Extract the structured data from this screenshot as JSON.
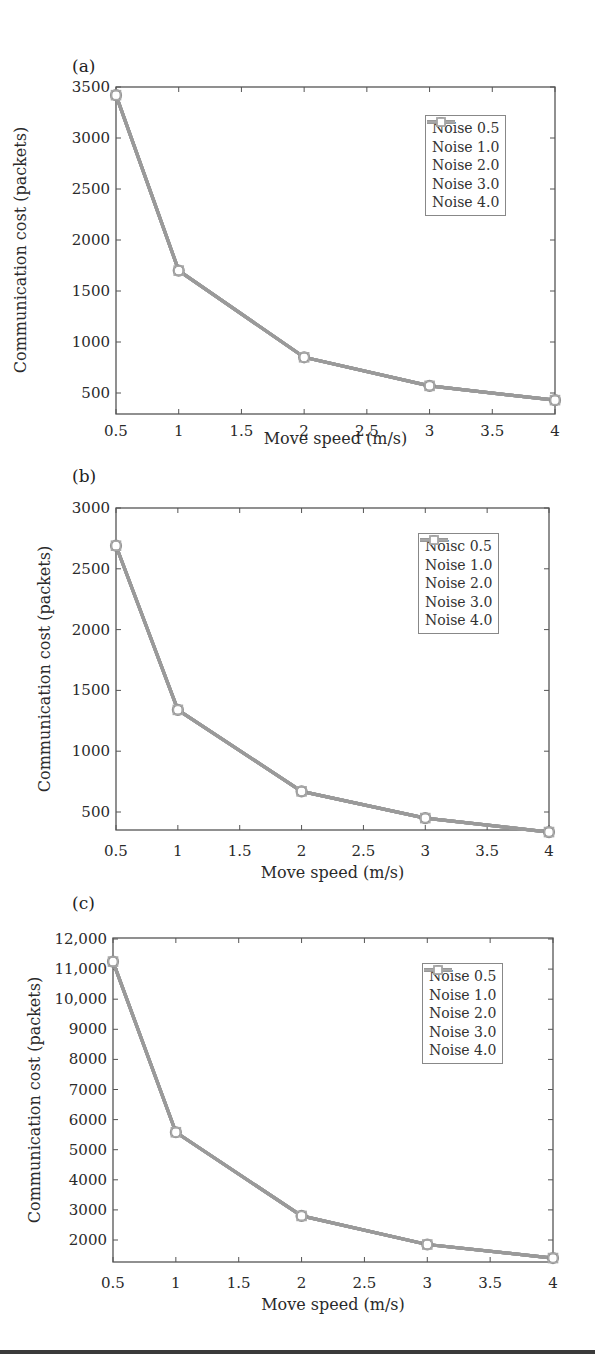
{
  "figure": {
    "panels": [
      {
        "label": "(a)"
      },
      {
        "label": "(b)"
      },
      {
        "label": "(c)"
      }
    ]
  },
  "chart_data": [
    {
      "type": "line",
      "panel": "(a)",
      "title": "",
      "xlabel": "Move speed (m/s)",
      "ylabel": "Communication cost (packets)",
      "x": [
        0.5,
        1,
        2,
        3,
        4
      ],
      "xlim": [
        0.5,
        4
      ],
      "ylim": [
        320,
        3500
      ],
      "xticks": [
        "0.5",
        "1",
        "1.5",
        "2",
        "2.5",
        "3",
        "3.5",
        "4"
      ],
      "yticks": [
        "500",
        "1000",
        "1500",
        "2000",
        "2500",
        "3000",
        "3500"
      ],
      "grid": false,
      "legend_position": "upper right",
      "legend": [
        "Noise 0.5",
        "Noise 1.0",
        "Noise 2.0",
        "Noise 3.0",
        "Noise 4.0"
      ],
      "series": [
        {
          "name": "Noise 0.5",
          "values": [
            3420,
            1700,
            850,
            570,
            430
          ]
        },
        {
          "name": "Noise 1.0",
          "values": [
            3420,
            1700,
            850,
            570,
            430
          ]
        },
        {
          "name": "Noise 2.0",
          "values": [
            3420,
            1700,
            850,
            570,
            430
          ]
        },
        {
          "name": "Noise 3.0",
          "values": [
            3420,
            1700,
            850,
            570,
            430
          ]
        },
        {
          "name": "Noise 4.0",
          "values": [
            3420,
            1700,
            850,
            570,
            430
          ]
        }
      ]
    },
    {
      "type": "line",
      "panel": "(b)",
      "title": "",
      "xlabel": "Move speed (m/s)",
      "ylabel": "Communication cost (packets)",
      "x": [
        0.5,
        1,
        2,
        3,
        4
      ],
      "xlim": [
        0.5,
        4
      ],
      "ylim": [
        320,
        3000
      ],
      "xticks": [
        "0.5",
        "1",
        "1.5",
        "2",
        "2.5",
        "3",
        "3.5",
        "4"
      ],
      "yticks": [
        "500",
        "1000",
        "1500",
        "2000",
        "2500",
        "3000"
      ],
      "grid": false,
      "legend_position": "upper right",
      "legend": [
        "Noisc 0.5",
        "Noise 1.0",
        "Noise 2.0",
        "Noise 3.0",
        "Noise 4.0"
      ],
      "series": [
        {
          "name": "Noise 0.5",
          "values": [
            2690,
            1340,
            670,
            450,
            335
          ]
        },
        {
          "name": "Noise 1.0",
          "values": [
            2690,
            1340,
            670,
            450,
            335
          ]
        },
        {
          "name": "Noise 2.0",
          "values": [
            2690,
            1340,
            670,
            450,
            335
          ]
        },
        {
          "name": "Noise 3.0",
          "values": [
            2690,
            1340,
            670,
            450,
            335
          ]
        },
        {
          "name": "Noise 4.0",
          "values": [
            2690,
            1340,
            670,
            450,
            335
          ]
        }
      ]
    },
    {
      "type": "line",
      "panel": "(c)",
      "title": "",
      "xlabel": "Move speed (m/s)",
      "ylabel": "Communication cost (packets)",
      "x": [
        0.5,
        1,
        2,
        3,
        4
      ],
      "xlim": [
        0.5,
        4
      ],
      "ylim": [
        1300,
        12000
      ],
      "xticks": [
        "0.5",
        "1",
        "1.5",
        "2",
        "2.5",
        "3",
        "3.5",
        "4"
      ],
      "yticks": [
        "2000",
        "3000",
        "4000",
        "5000",
        "6000",
        "7000",
        "8000",
        "9000",
        "10,000",
        "11,000",
        "12,000"
      ],
      "grid": false,
      "legend_position": "upper right",
      "legend": [
        "Noise 0.5",
        "Noise 1.0",
        "Noise 2.0",
        "Noise 3.0",
        "Noise 4.0"
      ],
      "series": [
        {
          "name": "Noise 0.5",
          "values": [
            11250,
            5580,
            2800,
            1850,
            1400
          ]
        },
        {
          "name": "Noise 1.0",
          "values": [
            11250,
            5580,
            2800,
            1850,
            1400
          ]
        },
        {
          "name": "Noise 2.0",
          "values": [
            11250,
            5580,
            2800,
            1850,
            1400
          ]
        },
        {
          "name": "Noise 3.0",
          "values": [
            11250,
            5580,
            2800,
            1850,
            1400
          ]
        },
        {
          "name": "Noise 4.0",
          "values": [
            11250,
            5580,
            2800,
            1850,
            1400
          ]
        }
      ]
    }
  ],
  "style": {
    "line_color": "#9a9a9a",
    "axis_color": "#555555",
    "legend_colors": [
      "#b0b0b0",
      "#8a8a8a",
      "#5a5a5a",
      "#8f8f8f",
      "#a6a6a6"
    ],
    "legend_markers": [
      "circle-filled",
      "none",
      "circle-open",
      "star",
      "square-open"
    ]
  }
}
